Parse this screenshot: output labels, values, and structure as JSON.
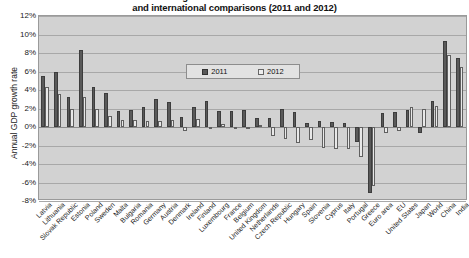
{
  "chart_data": {
    "type": "bar",
    "title": "Annual GDP growth rate in the EU Member States\nand international comparisons (2011 and 2012)",
    "xlabel": "",
    "ylabel": "Annual GDP growth rate",
    "ylim": [
      -8,
      12
    ],
    "ytick_step": 2,
    "grid": true,
    "legend_position": "top-center",
    "ytick_labels": [
      "12%",
      "10%",
      "8%",
      "6%",
      "4%",
      "2%",
      "0%",
      "-2%",
      "-4%",
      "-6%",
      "-8%"
    ],
    "categories": [
      "Latvia",
      "Lithuania",
      "Slovak Republic",
      "Estonia",
      "Poland",
      "Sweden",
      "Malta",
      "Bulgaria",
      "Romania",
      "Germany",
      "Austria",
      "Denmark",
      "Ireland",
      "Finland",
      "Luxembourg",
      "France",
      "Belgium",
      "United Kingdom",
      "Netherlands",
      "Czech Republic",
      "Hungary",
      "Spain",
      "Slovenia",
      "Cyprus",
      "Italy",
      "Portugal",
      "Greece",
      "Euro area",
      "EU",
      "United States",
      "Japan",
      "World",
      "China",
      "India"
    ],
    "series": [
      {
        "name": "2011",
        "color": "#595959",
        "values": [
          5.5,
          5.9,
          3.2,
          8.3,
          4.3,
          3.7,
          1.7,
          1.8,
          2.2,
          3.0,
          2.7,
          1.1,
          2.2,
          2.8,
          1.7,
          1.7,
          1.8,
          1.0,
          1.0,
          1.9,
          1.6,
          0.4,
          0.6,
          0.5,
          0.4,
          -1.6,
          -7.1,
          1.5,
          1.6,
          1.8,
          -0.6,
          2.8,
          9.3,
          7.5
        ]
      },
      {
        "name": "2012",
        "color": "#e8e8e8",
        "values": [
          4.3,
          3.6,
          2.0,
          3.2,
          2.0,
          1.2,
          0.8,
          0.8,
          0.7,
          0.7,
          0.8,
          -0.4,
          0.9,
          -0.2,
          0.3,
          0.0,
          -0.2,
          0.2,
          -1.0,
          -1.3,
          -1.7,
          -1.4,
          -2.3,
          -2.4,
          -2.4,
          -3.2,
          -6.4,
          -0.6,
          -0.4,
          2.2,
          2.0,
          2.3,
          7.8,
          6.5
        ]
      }
    ]
  },
  "legend": {
    "items": [
      {
        "label": "2011"
      },
      {
        "label": "2012"
      }
    ]
  }
}
